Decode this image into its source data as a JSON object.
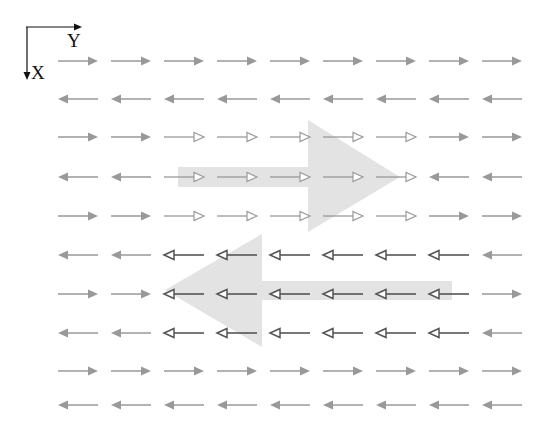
{
  "axes": {
    "x_label": "X",
    "y_label": "Y"
  },
  "colors": {
    "arrow_grey": "#999999",
    "arrow_dark": "#555555",
    "big_arrow": "#e3e3e3",
    "hollow_light_stroke": "#9a9a9a"
  },
  "grid": {
    "columns": 9,
    "rows": 10,
    "col_start_x": [
      58,
      111,
      164,
      217,
      270,
      323,
      376,
      429,
      482
    ],
    "row_y": [
      61,
      99,
      137,
      177,
      216,
      255,
      294,
      333,
      371,
      405
    ],
    "arrow_length": 40
  },
  "rows": [
    {
      "dir": [
        "R",
        "R",
        "R",
        "R",
        "R",
        "R",
        "R",
        "R",
        "R"
      ],
      "style": [
        "f",
        "f",
        "f",
        "f",
        "f",
        "f",
        "f",
        "f",
        "f"
      ]
    },
    {
      "dir": [
        "L",
        "L",
        "L",
        "L",
        "L",
        "L",
        "L",
        "L",
        "L"
      ],
      "style": [
        "f",
        "f",
        "f",
        "f",
        "f",
        "f",
        "f",
        "f",
        "f"
      ]
    },
    {
      "dir": [
        "R",
        "R",
        "R",
        "R",
        "R",
        "R",
        "R",
        "R",
        "R"
      ],
      "style": [
        "f",
        "f",
        "h",
        "h",
        "h",
        "h",
        "h",
        "f",
        "f"
      ]
    },
    {
      "dir": [
        "L",
        "L",
        "R",
        "R",
        "R",
        "R",
        "R",
        "L",
        "L"
      ],
      "style": [
        "f",
        "f",
        "h",
        "h",
        "h",
        "h",
        "h",
        "f",
        "f"
      ]
    },
    {
      "dir": [
        "R",
        "R",
        "R",
        "R",
        "R",
        "R",
        "R",
        "R",
        "R"
      ],
      "style": [
        "f",
        "f",
        "h",
        "h",
        "h",
        "h",
        "h",
        "f",
        "f"
      ]
    },
    {
      "dir": [
        "L",
        "L",
        "L",
        "L",
        "L",
        "L",
        "L",
        "L",
        "L"
      ],
      "style": [
        "f",
        "f",
        "d",
        "d",
        "d",
        "d",
        "d",
        "d",
        "f"
      ]
    },
    {
      "dir": [
        "R",
        "R",
        "L",
        "L",
        "L",
        "L",
        "L",
        "L",
        "R"
      ],
      "style": [
        "f",
        "f",
        "d",
        "d",
        "d",
        "d",
        "d",
        "d",
        "f"
      ]
    },
    {
      "dir": [
        "L",
        "L",
        "L",
        "L",
        "L",
        "L",
        "L",
        "L",
        "L"
      ],
      "style": [
        "f",
        "f",
        "d",
        "d",
        "d",
        "d",
        "d",
        "d",
        "f"
      ]
    },
    {
      "dir": [
        "R",
        "R",
        "R",
        "R",
        "R",
        "R",
        "R",
        "R",
        "R"
      ],
      "style": [
        "f",
        "f",
        "f",
        "f",
        "f",
        "f",
        "f",
        "f",
        "f"
      ]
    },
    {
      "dir": [
        "L",
        "L",
        "L",
        "L",
        "L",
        "L",
        "L",
        "L",
        "L"
      ],
      "style": [
        "f",
        "f",
        "f",
        "f",
        "f",
        "f",
        "f",
        "f",
        "f"
      ]
    }
  ],
  "big_arrows": [
    {
      "name": "big-right-arrow",
      "points": "178,167 308,167 308,120 400,177 308,232 308,187 178,187"
    },
    {
      "name": "big-left-arrow",
      "points": "452,281 262,281 262,234 165,290 262,347 262,300 452,300"
    }
  ]
}
